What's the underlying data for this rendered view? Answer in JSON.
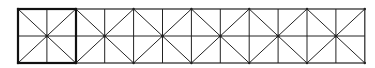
{
  "diagram": {
    "type": "tiled-square-pattern",
    "tile_count": 6,
    "highlighted_tile_index": 0,
    "tile_subdivisions": [
      "vertical-midline",
      "horizontal-midline",
      "diagonal",
      "anti-diagonal"
    ],
    "colors": {
      "stroke": "#222222",
      "background": "#ffffff"
    }
  }
}
